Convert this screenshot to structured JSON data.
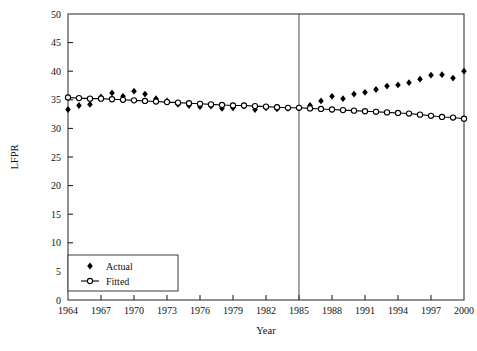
{
  "chart_data": {
    "type": "scatter",
    "title": "",
    "xlabel": "Year",
    "ylabel": "LFPR",
    "xlim": [
      1964,
      2000
    ],
    "ylim": [
      0,
      50
    ],
    "ytick_step": 5,
    "xtick_step": 3,
    "grid": false,
    "legend_position": "bottom-left",
    "xticks": [
      1964,
      1967,
      1970,
      1973,
      1976,
      1979,
      1982,
      1985,
      1988,
      1991,
      1994,
      1997,
      2000
    ],
    "yticks": [
      0,
      5,
      10,
      15,
      20,
      25,
      30,
      35,
      40,
      45,
      50
    ],
    "x": [
      1964,
      1965,
      1966,
      1967,
      1968,
      1969,
      1970,
      1971,
      1972,
      1973,
      1974,
      1975,
      1976,
      1977,
      1978,
      1979,
      1980,
      1981,
      1982,
      1983,
      1984,
      1985,
      1986,
      1987,
      1988,
      1989,
      1990,
      1991,
      1992,
      1993,
      1994,
      1995,
      1996,
      1997,
      1998,
      1999,
      2000
    ],
    "series": [
      {
        "name": "Actual",
        "marker": "filled-diamond",
        "line": false,
        "color": "#000000",
        "values": [
          33.3,
          34.0,
          34.2,
          35.5,
          36.2,
          35.6,
          36.5,
          36.0,
          35.2,
          34.8,
          34.2,
          34.0,
          33.8,
          33.9,
          33.5,
          33.6,
          33.9,
          33.3,
          33.6,
          33.4,
          33.5,
          33.6,
          34.0,
          34.8,
          35.6,
          35.2,
          36.0,
          36.3,
          36.8,
          37.4,
          37.6,
          38.0,
          38.6,
          39.3,
          39.4,
          38.8,
          40.0
        ]
      },
      {
        "name": "Fitted",
        "marker": "open-circle",
        "line": true,
        "color": "#000000",
        "values": [
          35.4,
          35.3,
          35.2,
          35.2,
          35.1,
          35.0,
          34.9,
          34.8,
          34.7,
          34.6,
          34.5,
          34.4,
          34.3,
          34.2,
          34.1,
          34.0,
          34.0,
          33.9,
          33.8,
          33.7,
          33.6,
          33.6,
          33.5,
          33.4,
          33.3,
          33.2,
          33.1,
          33.0,
          32.9,
          32.8,
          32.7,
          32.6,
          32.4,
          32.2,
          32.0,
          31.9,
          31.7
        ]
      }
    ],
    "annotations": [
      {
        "type": "vertical-line",
        "x": 1985,
        "label": ""
      }
    ]
  },
  "legend": {
    "entries": [
      {
        "label": "Actual"
      },
      {
        "label": "Fitted"
      }
    ]
  }
}
